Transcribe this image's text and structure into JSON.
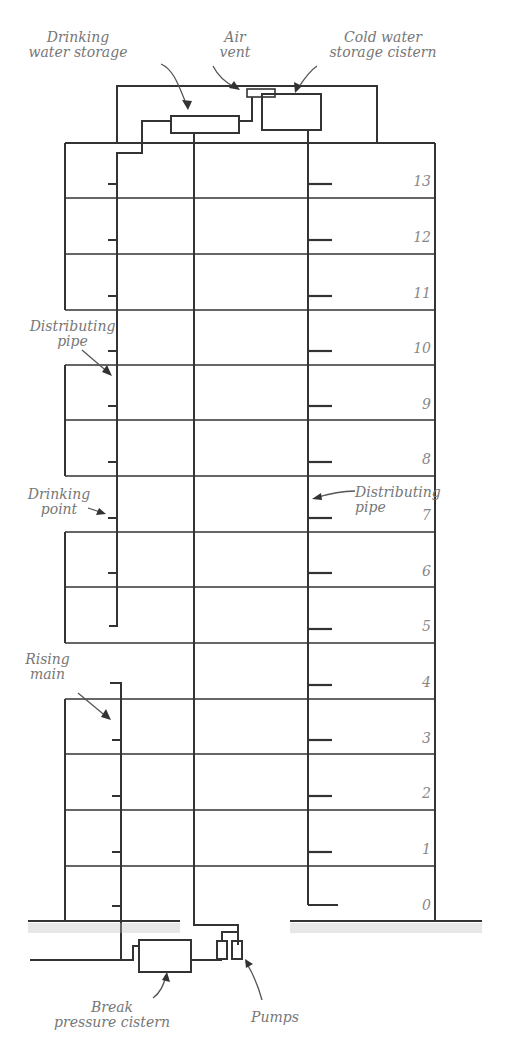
{
  "diagram": {
    "labels": {
      "drinking_water_storage": [
        "Drinking",
        "water storage"
      ],
      "air_vent": [
        "Air",
        "vent"
      ],
      "cold_water_storage_cistern": [
        "Cold water",
        "storage cistern"
      ],
      "distributing_pipe_left": [
        "Distributing",
        "pipe"
      ],
      "drinking_point": [
        "Drinking",
        "point"
      ],
      "distributing_pipe_right": [
        "Distributing",
        "pipe"
      ],
      "rising_main": [
        "Rising",
        "main"
      ],
      "break_pressure_cistern": [
        "Break",
        "pressure cistern"
      ],
      "pumps": [
        "Pumps"
      ]
    },
    "floors": [
      "13",
      "12",
      "11",
      "10",
      "9",
      "8",
      "7",
      "6",
      "5",
      "4",
      "3",
      "2",
      "1",
      "0"
    ],
    "colors": {
      "line": "#333333",
      "label": "#777777",
      "ground_hatch": "#aaaaaa"
    }
  }
}
